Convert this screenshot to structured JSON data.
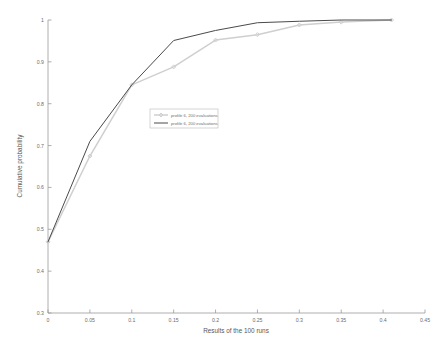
{
  "chart_data": {
    "type": "line",
    "title": "",
    "xlabel": "Results of the 100 runs",
    "ylabel": "Cumulative probability",
    "xlim": [
      0,
      0.45
    ],
    "ylim": [
      0.3,
      1.0
    ],
    "grid": false,
    "legend_position": "center-left",
    "xticks": [
      "0",
      "0.05",
      "0.1",
      "0.15",
      "0.2",
      "0.25",
      "0.3",
      "0.35",
      "0.4",
      "0.45"
    ],
    "xtick_values": [
      0,
      0.05,
      0.1,
      0.15,
      0.2,
      0.25,
      0.3,
      0.35,
      0.4,
      0.45
    ],
    "yticks": [
      "0.3",
      "0.4",
      "0.5",
      "0.6",
      "0.7",
      "0.8",
      "0.9",
      "1"
    ],
    "ytick_values": [
      0.3,
      0.4,
      0.5,
      0.6,
      0.7,
      0.8,
      0.9,
      1.0
    ],
    "series": [
      {
        "name": "profile 6, 200 evaluations",
        "color": "#cfcfcf",
        "marker": "diamond",
        "x": [
          0,
          0.05,
          0.1,
          0.15,
          0.2,
          0.25,
          0.3,
          0.35,
          0.41
        ],
        "y": [
          0.47,
          0.675,
          0.845,
          0.888,
          0.952,
          0.965,
          0.988,
          0.995,
          1.0
        ]
      },
      {
        "name": "profile 6, 200 evaluations",
        "color": "#4a4a4a",
        "marker": "none",
        "x": [
          0,
          0.05,
          0.1,
          0.15,
          0.2,
          0.25,
          0.3,
          0.35,
          0.41
        ],
        "y": [
          0.47,
          0.71,
          0.845,
          0.951,
          0.975,
          0.9935,
          0.997,
          1.0,
          1.0
        ]
      }
    ]
  },
  "axes": {
    "xlabel": "Results of the 100 runs",
    "ylabel": "Cumulative probability"
  },
  "legend": {
    "entries": [
      {
        "label": "profile 6, 200 evaluations"
      },
      {
        "label": "profile 6, 200 evaluations"
      }
    ]
  }
}
